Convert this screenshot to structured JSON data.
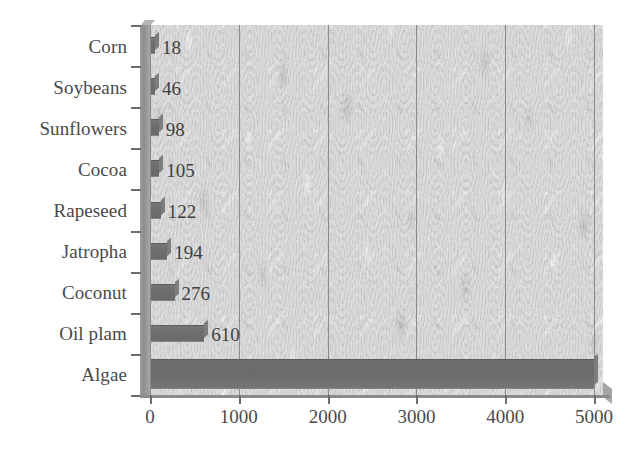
{
  "chart_data": {
    "type": "bar",
    "orientation": "horizontal",
    "title": "",
    "xlabel": "",
    "ylabel": "",
    "xlim": [
      0,
      5100
    ],
    "ylim": null,
    "grid": "vertical",
    "legend": "none",
    "categories": [
      "Corn",
      "Soybeans",
      "Sunflowers",
      "Cocoa",
      "Rapeseed",
      "Jatropha",
      "Coconut",
      "Oil plam",
      "Algae"
    ],
    "values": [
      18,
      46,
      98,
      105,
      122,
      194,
      276,
      610,
      5000
    ],
    "data_labels": [
      "18",
      "46",
      "98",
      "105",
      "122",
      "194",
      "276",
      "610",
      ""
    ],
    "xticks": [
      0,
      1000,
      2000,
      3000,
      4000,
      5000
    ],
    "xtick_labels": [
      "0",
      "1000",
      "2000",
      "3000",
      "4000",
      "5000"
    ],
    "gridline_values": [
      1000,
      2000,
      3000,
      4000,
      5000
    ],
    "bar_color": "#6e6e6e",
    "plot_background": "#d8d8d8",
    "axis_color": "#8b8b8b",
    "text_color": "#4a4a4a",
    "page_background": "#ffffff"
  }
}
